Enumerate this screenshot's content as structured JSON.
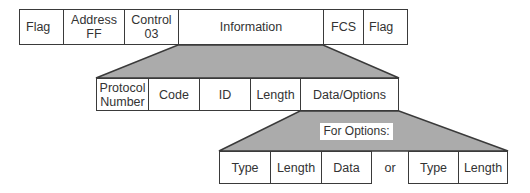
{
  "colors": {
    "trapezoid_fill": "#ababab",
    "border": "#3a3a3a",
    "cell_bg": "#ffffff"
  },
  "frame_row": {
    "cells": [
      {
        "label": "Flag"
      },
      {
        "label": "Address\nFF"
      },
      {
        "label": "Control\n03"
      },
      {
        "label": "Information"
      },
      {
        "label": "FCS"
      },
      {
        "label": "Flag"
      }
    ]
  },
  "information_row": {
    "cells": [
      {
        "label": "Protocol\nNumber"
      },
      {
        "label": "Code"
      },
      {
        "label": "ID"
      },
      {
        "label": "Length"
      },
      {
        "label": "Data/Options"
      }
    ]
  },
  "options_label": "For Options:",
  "options_row": {
    "cells": [
      {
        "label": "Type"
      },
      {
        "label": "Length"
      },
      {
        "label": "Data"
      },
      {
        "label": "or"
      },
      {
        "label": "Type"
      },
      {
        "label": "Length"
      }
    ]
  }
}
